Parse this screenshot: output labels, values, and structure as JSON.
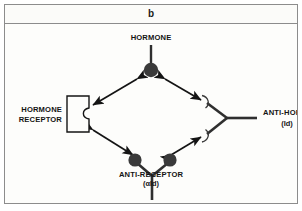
{
  "figure": {
    "panel_letter": "b",
    "background_color": "#fdfdfb",
    "border_color": "#8c8c8c",
    "ink_color": "#141414",
    "node_fill_color": "#3a3a3a"
  },
  "nodes": {
    "hormone": {
      "label": "HORMONE",
      "sublabel": "",
      "glyph": "filled-circle-on-stem"
    },
    "hormone_receptor": {
      "label_line1": "HORMONE",
      "label_line2": "RECEPTOR",
      "glyph": "notched-rectangle"
    },
    "anti_hormone": {
      "label": "ANTI-HORMONE",
      "sublabel": "(Id)",
      "glyph": "antibody-y-with-crescent-arms"
    },
    "anti_receptor": {
      "label": "ANTI-RECEPTOR",
      "sublabel": "(αId)",
      "glyph": "antibody-y-with-filled-circles"
    }
  },
  "connections": [
    {
      "name": "hormone-to-receptor",
      "from": "hormone",
      "to": "hormone_receptor",
      "style": "double-headed-arrow"
    },
    {
      "name": "hormone-to-anti-hormone",
      "from": "hormone",
      "to": "anti_hormone",
      "style": "double-headed-arrow"
    },
    {
      "name": "receptor-to-anti-receptor",
      "from": "hormone_receptor",
      "to": "anti_receptor",
      "style": "double-headed-arrow"
    },
    {
      "name": "anti-receptor-to-anti-hormone",
      "from": "anti_receptor",
      "to": "anti_hormone",
      "style": "double-headed-arrow"
    }
  ]
}
